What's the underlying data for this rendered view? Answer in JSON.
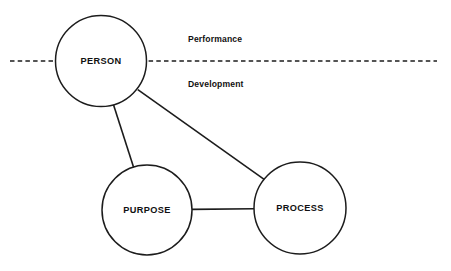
{
  "diagram": {
    "title": "Person Purpose Process",
    "background_color": "#ffffff",
    "stroke_color": "#1c1c1c",
    "width": 451,
    "height": 271,
    "nodes": [
      {
        "id": "person",
        "label": "PERSON",
        "shape": "circle",
        "cx": 101,
        "cy": 61,
        "r": 45.5
      },
      {
        "id": "purpose",
        "label": "PURPOSE",
        "shape": "circle",
        "cx": 147,
        "cy": 210,
        "r": 45
      },
      {
        "id": "process",
        "label": "PROCESS",
        "shape": "circle",
        "cx": 300,
        "cy": 208,
        "r": 46
      }
    ],
    "edges": [
      {
        "id": "person-purpose",
        "from": "person",
        "to": "purpose",
        "style": "solid"
      },
      {
        "id": "person-process",
        "from": "person",
        "to": "process",
        "style": "solid"
      },
      {
        "id": "purpose-process",
        "from": "purpose",
        "to": "process",
        "style": "solid"
      }
    ],
    "divider": {
      "id": "performance-development-divider",
      "style": "dashed",
      "y": 61,
      "x1": 10,
      "x2": 437
    },
    "zone_labels": [
      {
        "id": "performance",
        "label": "Performance",
        "x": 188,
        "y": 40
      },
      {
        "id": "development",
        "label": "Development",
        "x": 188,
        "y": 85
      }
    ]
  }
}
